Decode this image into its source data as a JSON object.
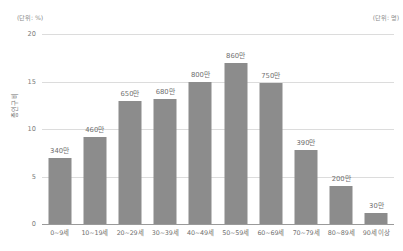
{
  "captions": {
    "left_unit": "(단위: %)",
    "right_unit": "(단위: 명)"
  },
  "axis": {
    "y_title": "총인구비",
    "y_ticks": [
      "0",
      "5",
      "10",
      "15",
      "20"
    ]
  },
  "chart_data": {
    "type": "bar",
    "title": "",
    "subtitle": "",
    "xlabel": "",
    "ylabel": "총인구비",
    "ylim": [
      0,
      20
    ],
    "yticks": [
      0,
      5,
      10,
      15,
      20
    ],
    "grid": true,
    "legend": "none",
    "bar_color": "#8c8c8c",
    "gridline_color": "#dcdcdc",
    "axis_color": "#9a9a9a",
    "left_unit": "(단위: %)",
    "right_unit": "(단위: 명)",
    "categories": [
      "0~9세",
      "10~19세",
      "20~29세",
      "30~39세",
      "40~49세",
      "50~59세",
      "60~69세",
      "70~79세",
      "80~89세",
      "90세 이상"
    ],
    "values": [
      7.0,
      9.2,
      13.0,
      13.2,
      15.0,
      17.0,
      14.8,
      7.8,
      4.0,
      1.2
    ],
    "data_labels": [
      "340만",
      "460만",
      "650만",
      "680만",
      "800만",
      "860만",
      "750만",
      "390만",
      "200만",
      "30만"
    ]
  }
}
